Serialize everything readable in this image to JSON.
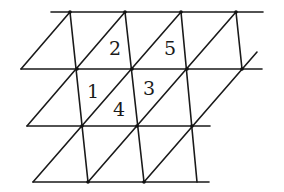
{
  "diagram": {
    "type": "triangular lattice (sheared grid with diagonals)",
    "labels": [
      {
        "text": "2",
        "x": 115,
        "y": 48
      },
      {
        "text": "5",
        "x": 170,
        "y": 48
      },
      {
        "text": "1",
        "x": 93,
        "y": 91
      },
      {
        "text": "3",
        "x": 149,
        "y": 88
      },
      {
        "text": "4",
        "x": 119,
        "y": 109
      }
    ],
    "horizontals": [
      {
        "x1": 51,
        "y": 12,
        "x2": 263
      },
      {
        "x1": 21,
        "y": 69,
        "x2": 262
      },
      {
        "x1": 27,
        "y": 126,
        "x2": 210
      },
      {
        "x1": 33,
        "y": 182,
        "x2": 209
      }
    ],
    "verticals": [
      {
        "x1": 70,
        "y1": 12,
        "x2": 88,
        "y2": 182
      },
      {
        "x1": 125,
        "y1": 12,
        "x2": 144,
        "y2": 182
      },
      {
        "x1": 236,
        "y1": 12,
        "x2": 242,
        "y2": 69
      },
      {
        "x1": 181,
        "y1": 12,
        "x2": 197,
        "y2": 182
      }
    ],
    "diagonals": [
      {
        "x1": 21,
        "y1": 69,
        "x2": 70,
        "y2": 12
      },
      {
        "x1": 27,
        "y1": 126,
        "x2": 125,
        "y2": 12
      },
      {
        "x1": 33,
        "y1": 182,
        "x2": 181,
        "y2": 12
      },
      {
        "x1": 88,
        "y1": 182,
        "x2": 236,
        "y2": 12
      },
      {
        "x1": 144,
        "y1": 182,
        "x2": 257,
        "y2": 52
      }
    ],
    "vertices": [
      {
        "x": 70,
        "y": 12
      },
      {
        "x": 125,
        "y": 12
      },
      {
        "x": 181,
        "y": 12
      },
      {
        "x": 236,
        "y": 12
      },
      {
        "x": 77,
        "y": 69
      },
      {
        "x": 132,
        "y": 69
      },
      {
        "x": 187,
        "y": 69
      },
      {
        "x": 242,
        "y": 69
      },
      {
        "x": 82,
        "y": 126
      },
      {
        "x": 137,
        "y": 126
      },
      {
        "x": 192,
        "y": 126
      },
      {
        "x": 88,
        "y": 182
      },
      {
        "x": 144,
        "y": 182
      }
    ]
  }
}
